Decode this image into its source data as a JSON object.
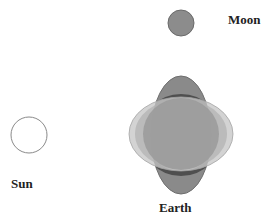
{
  "diagram": {
    "labels": {
      "moon": "Moon",
      "sun": "Sun",
      "earth": "Earth"
    },
    "bodies": {
      "moon": {
        "cx": 181,
        "cy": 23,
        "r": 13,
        "fill": "#8c8c8c",
        "stroke": "#6a6a6a"
      },
      "sun": {
        "cx": 29,
        "cy": 135,
        "r": 18,
        "fill": "#ffffff",
        "stroke": "#8a8a8a"
      },
      "earth_core": {
        "cx": 181,
        "cy": 135,
        "r": 42,
        "fill": "#9a9a9a"
      }
    },
    "bulges": {
      "lunar_tide": {
        "cx": 181,
        "cy": 135,
        "rx": 30,
        "ry": 59,
        "fill": "#8a8a8a",
        "stroke": "#6e6e6e",
        "orientation": "toward moon"
      },
      "solar_tide": {
        "cx": 181,
        "cy": 134,
        "rx": 52,
        "ry": 37,
        "fill": "#c4c4c4",
        "opacity": 0.75,
        "orientation": "toward sun"
      }
    },
    "colors": {
      "dark_band": "#4f4f4f",
      "earth_gray": "#9a9a9a",
      "light_gray": "#c8c8c8"
    }
  }
}
